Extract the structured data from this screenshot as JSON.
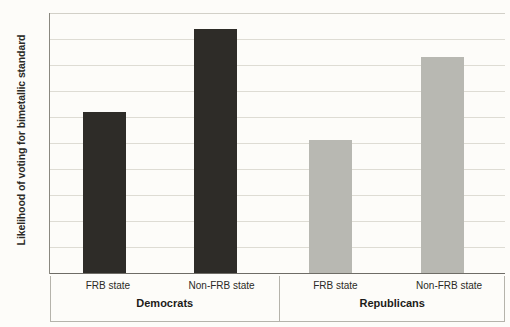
{
  "chart_data": {
    "type": "bar",
    "title": "",
    "subtitle": "",
    "xlabel": "",
    "ylabel": "Likelihood of voting for bimetallic standard",
    "ylim": [
      0,
      1
    ],
    "ytick_labels": [
      "1",
      "0.9",
      "0.8",
      "0.7",
      "0.6",
      "0.5",
      "0.4",
      "0.3",
      "0.2",
      "0.1",
      "0"
    ],
    "ytick_values": [
      1,
      0.9,
      0.8,
      0.7,
      0.6,
      0.5,
      0.4,
      0.3,
      0.2,
      0.1,
      0
    ],
    "grid": true,
    "legend": "none",
    "groups": [
      {
        "name": "Democrats",
        "color": "#2e2c28",
        "categories": [
          "FRB state",
          "Non-FRB state"
        ],
        "values": [
          0.62,
          0.94
        ]
      },
      {
        "name": "Republicans",
        "color": "#b8b8b2",
        "categories": [
          "FRB state",
          "Non-FRB state"
        ],
        "values": [
          0.51,
          0.83
        ]
      }
    ],
    "categories": [
      "FRB state",
      "Non-FRB state",
      "FRB state",
      "Non-FRB state"
    ],
    "values": [
      0.62,
      0.94,
      0.51,
      0.83
    ],
    "bar_colors": [
      "#2e2c28",
      "#2e2c28",
      "#b8b8b2",
      "#b8b8b2"
    ]
  },
  "colors": {
    "background": "#fdfcf9",
    "grid": "#dedcd4",
    "axis": "#6e6c66",
    "text": "#2b2a26",
    "dark_bar": "#2e2c28",
    "light_bar": "#b8b8b2",
    "box_border": "#b5b3ab"
  }
}
